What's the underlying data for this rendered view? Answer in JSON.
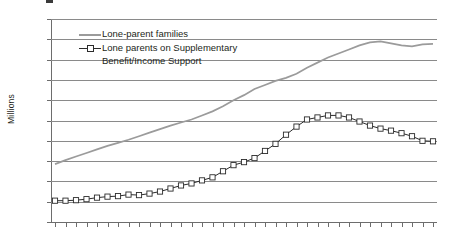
{
  "chart_data": {
    "type": "line",
    "title": "",
    "xlabel": "",
    "ylabel": "Millions",
    "ylim": [
      0,
      2
    ],
    "ytick_values": [
      0,
      0.2,
      0.4,
      0.6,
      0.8,
      1,
      1.2,
      1.4,
      1.6,
      1.8,
      2
    ],
    "ytick_labels": [
      "0",
      "0.2",
      "0.4",
      "0.6",
      "0.8",
      "1",
      "1.2",
      "1.4",
      "1.6",
      "1.8",
      "2"
    ],
    "grid": "horizontal",
    "legend_position": "top-left-inside",
    "categories": [
      "1971",
      "1972",
      "1973",
      "1974",
      "1975",
      "1976",
      "1977",
      "1978",
      "1979",
      "1980",
      "1981",
      "1982",
      "1983",
      "1984",
      "1985",
      "1986",
      "1987",
      "1988",
      "1989",
      "1990",
      "1991",
      "1992",
      "1993",
      "1994",
      "1995",
      "1996",
      "1997",
      "1998",
      "1999",
      "2000",
      "2001",
      "2002",
      "2003",
      "2004",
      "2005",
      "2006",
      "2007"
    ],
    "series": [
      {
        "name": "Lone-parent families",
        "color": "#9b9b9b",
        "marker": "none",
        "values": [
          0.57,
          0.61,
          0.645,
          0.68,
          0.715,
          0.75,
          0.78,
          0.81,
          0.845,
          0.88,
          0.915,
          0.95,
          0.98,
          1.01,
          1.05,
          1.09,
          1.14,
          1.2,
          1.25,
          1.31,
          1.35,
          1.39,
          1.42,
          1.46,
          1.52,
          1.57,
          1.62,
          1.66,
          1.7,
          1.74,
          1.77,
          1.78,
          1.76,
          1.74,
          1.73,
          1.75,
          1.755
        ]
      },
      {
        "name": "Lone parents on Supplementary Benefit/Income Support",
        "color": "#2b2b2b",
        "marker": "open-square",
        "values": [
          0.21,
          0.21,
          0.215,
          0.225,
          0.24,
          0.25,
          0.255,
          0.27,
          0.265,
          0.28,
          0.3,
          0.33,
          0.36,
          0.38,
          0.41,
          0.44,
          0.5,
          0.56,
          0.59,
          0.63,
          0.7,
          0.77,
          0.86,
          0.94,
          1.01,
          1.03,
          1.05,
          1.05,
          1.03,
          0.99,
          0.95,
          0.92,
          0.9,
          0.875,
          0.845,
          0.8,
          0.795
        ]
      }
    ]
  },
  "legend": {
    "items": [
      {
        "label": "Lone-parent families"
      },
      {
        "label": "Lone parents on Supplementary"
      },
      {
        "label": "Benefit/Income Support"
      }
    ]
  },
  "axis": {
    "y_title": "Millions"
  }
}
